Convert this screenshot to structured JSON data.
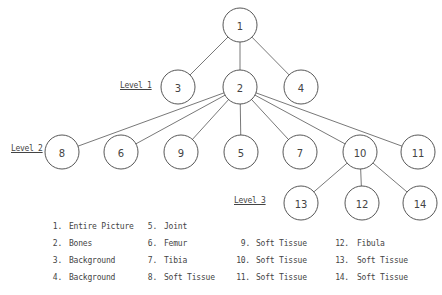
{
  "diagram": {
    "type": "tree",
    "nodes": [
      {
        "id": "1",
        "x": 240,
        "y": 25,
        "r": 17
      },
      {
        "id": "3",
        "x": 178,
        "y": 87,
        "r": 17
      },
      {
        "id": "2",
        "x": 240,
        "y": 87,
        "r": 17
      },
      {
        "id": "4",
        "x": 301,
        "y": 87,
        "r": 17
      },
      {
        "id": "8",
        "x": 62,
        "y": 152,
        "r": 17
      },
      {
        "id": "6",
        "x": 121,
        "y": 152,
        "r": 17
      },
      {
        "id": "9",
        "x": 181,
        "y": 152,
        "r": 17
      },
      {
        "id": "5",
        "x": 241,
        "y": 152,
        "r": 17
      },
      {
        "id": "7",
        "x": 300,
        "y": 152,
        "r": 17
      },
      {
        "id": "10",
        "x": 360,
        "y": 152,
        "r": 17
      },
      {
        "id": "11",
        "x": 418,
        "y": 152,
        "r": 17
      },
      {
        "id": "13",
        "x": 301,
        "y": 203,
        "r": 17
      },
      {
        "id": "12",
        "x": 362,
        "y": 203,
        "r": 17
      },
      {
        "id": "14",
        "x": 420,
        "y": 203,
        "r": 17
      }
    ],
    "edges": [
      [
        "1",
        "3"
      ],
      [
        "1",
        "2"
      ],
      [
        "1",
        "4"
      ],
      [
        "2",
        "8"
      ],
      [
        "2",
        "6"
      ],
      [
        "2",
        "9"
      ],
      [
        "2",
        "5"
      ],
      [
        "2",
        "7"
      ],
      [
        "2",
        "10"
      ],
      [
        "2",
        "11"
      ],
      [
        "10",
        "13"
      ],
      [
        "10",
        "12"
      ],
      [
        "10",
        "14"
      ]
    ],
    "levels": [
      {
        "label": "Level 1",
        "x": 120,
        "y": 81
      },
      {
        "label": "Level 2",
        "x": 11,
        "y": 144
      },
      {
        "label": "Level 3",
        "x": 234,
        "y": 196
      }
    ]
  },
  "legend": [
    {
      "num": "1.",
      "text": "Entire Picture",
      "col": 0,
      "row": 0
    },
    {
      "num": "2.",
      "text": "Bones",
      "col": 0,
      "row": 1
    },
    {
      "num": "3.",
      "text": "Background",
      "col": 0,
      "row": 2
    },
    {
      "num": "4.",
      "text": "Background",
      "col": 0,
      "row": 3
    },
    {
      "num": "5.",
      "text": "Joint",
      "col": 1,
      "row": 0
    },
    {
      "num": "6.",
      "text": "Femur",
      "col": 1,
      "row": 1
    },
    {
      "num": "7.",
      "text": "Tibia",
      "col": 1,
      "row": 2
    },
    {
      "num": "8.",
      "text": "Soft Tissue",
      "col": 1,
      "row": 3
    },
    {
      "num": "9.",
      "text": "Soft Tissue",
      "col": 2,
      "row": 1
    },
    {
      "num": "10.",
      "text": "Soft Tissue",
      "col": 2,
      "row": 2
    },
    {
      "num": "11.",
      "text": "Soft Tissue",
      "col": 2,
      "row": 3
    },
    {
      "num": "12.",
      "text": "Fibula",
      "col": 3,
      "row": 1
    },
    {
      "num": "13.",
      "text": "Soft Tissue",
      "col": 3,
      "row": 2
    },
    {
      "num": "14.",
      "text": "Soft Tissue",
      "col": 3,
      "row": 3
    }
  ],
  "legend_layout": {
    "col_num_x": [
      42,
      137,
      230,
      329
    ],
    "col_text_x": [
      69,
      164,
      256,
      357
    ],
    "row_y": [
      222,
      239,
      256,
      273
    ]
  }
}
